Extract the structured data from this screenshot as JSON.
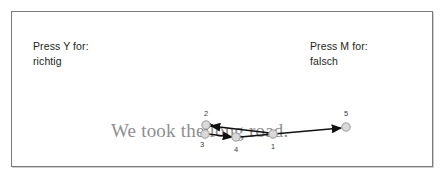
{
  "stimulus": {
    "frame_border_color": "#7b7b7b",
    "background_color": "#ffffff"
  },
  "prompts": {
    "left": {
      "instruction": "Press Y for:",
      "answer": "richtig"
    },
    "right": {
      "instruction": "Press M for:",
      "answer": "falsch"
    }
  },
  "sentence": {
    "text": "We took the long road.",
    "color": "#8e8e8e"
  },
  "scanpath": {
    "marker_fill": "#d9d9d9",
    "marker_stroke": "#9a9a9a",
    "arrow_color": "#111111",
    "fixations": [
      {
        "order": "1",
        "cx": 261,
        "cy": 122,
        "r": 4.2,
        "label_x": 259,
        "label_y": 137
      },
      {
        "order": "2",
        "cx": 194,
        "cy": 113,
        "r": 4.2,
        "label_x": 192,
        "label_y": 104
      },
      {
        "order": "3",
        "cx": 193,
        "cy": 122,
        "r": 4.2,
        "label_x": 188,
        "label_y": 135
      },
      {
        "order": "4",
        "cx": 224,
        "cy": 125,
        "r": 4.2,
        "label_x": 222,
        "label_y": 140
      },
      {
        "order": "5",
        "cx": 334,
        "cy": 115,
        "r": 4.2,
        "label_x": 332,
        "label_y": 104
      }
    ],
    "saccades": [
      {
        "from": "1",
        "to": "2",
        "x1": 258,
        "y1": 121,
        "x2": 199,
        "y2": 114
      },
      {
        "from": "2",
        "to": "3",
        "x1": 194,
        "y1": 117,
        "x2": 193,
        "y2": 119
      },
      {
        "from": "3",
        "to": "4",
        "x1": 196,
        "y1": 122,
        "x2": 220,
        "y2": 125
      },
      {
        "from": "4",
        "to": "5",
        "x1": 228,
        "y1": 125,
        "x2": 329,
        "y2": 116
      }
    ]
  }
}
